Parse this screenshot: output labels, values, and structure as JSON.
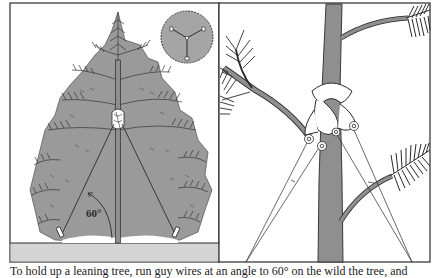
{
  "figure": {
    "panels": [
      {
        "id": "left",
        "description": "Conifer tree with guy lines staked at ground, inset top view",
        "angle_label": "60°",
        "inset": "top-view-three-stake-layout"
      },
      {
        "id": "right",
        "description": "Close-up of rope collar knot around trunk with three guy-line loops"
      }
    ],
    "colors": {
      "frame": "#2a2a2a",
      "tree_fill": "#9a9a9a",
      "ground": "#d4d4d4",
      "trunk": "#8f8f8f",
      "inset_fill": "#a5a5a5",
      "background": "#ffffff"
    }
  },
  "caption": {
    "text": "To hold up a leaning tree, run guy wires at an angle to 60° on the wild the tree, and"
  }
}
